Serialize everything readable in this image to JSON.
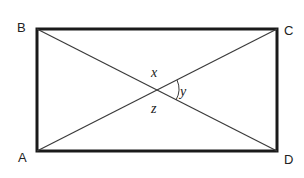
{
  "diagram": {
    "type": "rectangle-with-diagonals",
    "vertices": {
      "A": {
        "label": "A",
        "x": 37,
        "y": 151
      },
      "B": {
        "label": "B",
        "x": 37,
        "y": 29
      },
      "C": {
        "label": "C",
        "x": 277,
        "y": 29
      },
      "D": {
        "label": "D",
        "x": 277,
        "y": 151
      }
    },
    "diagonals": [
      "AC",
      "BD"
    ],
    "intersection": {
      "x": 157,
      "y": 90
    },
    "angle_labels": {
      "x": "x",
      "y": "y",
      "z": "z"
    },
    "colors": {
      "stroke": "#1a1a1a",
      "diagonal": "#3a3a3a",
      "text": "#222222"
    }
  }
}
